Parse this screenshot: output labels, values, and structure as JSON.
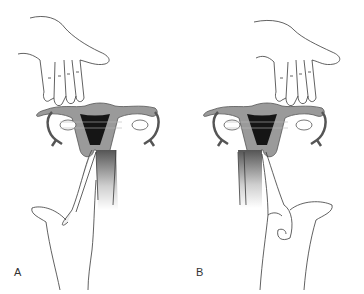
{
  "figure": {
    "panels": [
      {
        "id": "A",
        "label": "A",
        "description": "Bimanual examination, vaginal fingers in posterior position, abdominal hand pressing uterus"
      },
      {
        "id": "B",
        "label": "B",
        "description": "Bimanual examination, vaginal fingers in anterior position, abdominal hand pressing uterus"
      }
    ],
    "colors": {
      "line": "#3a3a3a",
      "uterus_fill": "#9a9a9a",
      "uterus_cavity": "#151515",
      "ovary_fill": "#ffffff",
      "background": "#ffffff"
    }
  }
}
